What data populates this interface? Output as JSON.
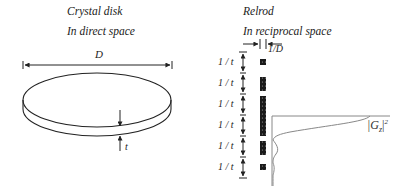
{
  "left_panel": {
    "title": "Crystal disk",
    "subtitle": "In direct space",
    "diameter_label": "D",
    "thickness_label": "t"
  },
  "right_panel": {
    "title": "Relrod",
    "subtitle": "In reciprocal space",
    "width_label": "1/D",
    "spacing_labels": [
      "1 / t",
      "1 / t",
      "1 / t",
      "1 / t",
      "1 / t",
      "1 / t"
    ],
    "profile_label": "|G",
    "profile_subscript": "z",
    "profile_superscript": "2"
  },
  "colors": {
    "line": "#222222",
    "rod_fill": "#1a1a1a",
    "rod_dots": "#9a9a9a",
    "profile": "#888888"
  }
}
